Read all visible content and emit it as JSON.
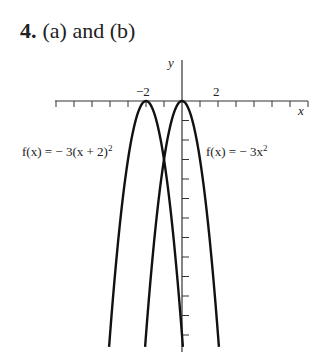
{
  "problem": {
    "number": "4.",
    "parts": "(a) and (b)"
  },
  "chart_data": {
    "type": "line",
    "title": "",
    "xlabel": "x",
    "ylabel": "y",
    "x_tick_labels": [
      {
        "value": -2,
        "label": "−2"
      },
      {
        "value": 2,
        "label": "2"
      }
    ],
    "xlim": [
      -7,
      7
    ],
    "ylim": [
      -12,
      1.5
    ],
    "grid": false,
    "series": [
      {
        "name": "f(x) = −3(x + 2)^2",
        "label": "f(x) = − 3(x + 2)",
        "exp": "2",
        "vertex": [
          -2,
          0
        ],
        "a": -3,
        "h": -2
      },
      {
        "name": "f(x) = −3x^2",
        "label": "f(x) = − 3x",
        "exp": "2",
        "vertex": [
          0,
          0
        ],
        "a": -3,
        "h": 0
      }
    ]
  }
}
